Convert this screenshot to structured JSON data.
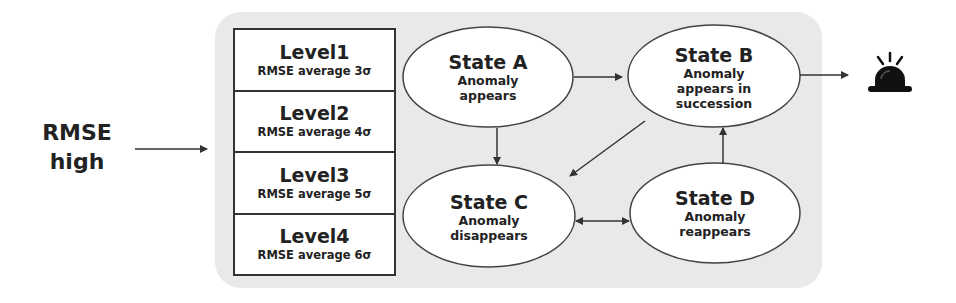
{
  "input": {
    "label_line1": "RMSE",
    "label_line2": "high"
  },
  "levels": [
    {
      "title": "Level1",
      "desc": "RMSE average 3σ"
    },
    {
      "title": "Level2",
      "desc": "RMSE average 4σ"
    },
    {
      "title": "Level3",
      "desc": "RMSE average 5σ"
    },
    {
      "title": "Level4",
      "desc": "RMSE average 6σ"
    }
  ],
  "states": {
    "a": {
      "title": "State A",
      "desc_line1": "Anomaly",
      "desc_line2": "appears"
    },
    "b": {
      "title": "State B",
      "desc_line1": "Anomaly",
      "desc_line2": "appears in",
      "desc_line3": "succession"
    },
    "c": {
      "title": "State C",
      "desc_line1": "Anomaly",
      "desc_line2": "disappears"
    },
    "d": {
      "title": "State D",
      "desc_line1": "Anomaly",
      "desc_line2": "reappears"
    }
  },
  "transitions": [
    {
      "from": "RMSE high",
      "to": "Levels"
    },
    {
      "from": "State A",
      "to": "State B"
    },
    {
      "from": "State A",
      "to": "State C"
    },
    {
      "from": "State B",
      "to": "State C"
    },
    {
      "from": "State D",
      "to": "State B"
    },
    {
      "from": "State C",
      "to": "State D",
      "bidirectional": true
    },
    {
      "from": "State B",
      "to": "Alarm"
    }
  ],
  "output": {
    "icon": "alarm-siren-icon"
  },
  "colors": {
    "panel": "#e9e9e9",
    "stroke": "#333333",
    "text": "#222222"
  }
}
